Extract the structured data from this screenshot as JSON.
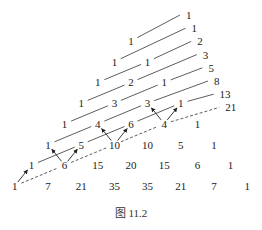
{
  "figure": {
    "caption": "图 11.2",
    "rows": [
      [
        1
      ],
      [
        1,
        1
      ],
      [
        1,
        2,
        1
      ],
      [
        1,
        3,
        3,
        1
      ],
      [
        1,
        4,
        6,
        4,
        1
      ],
      [
        1,
        5,
        10,
        10,
        5,
        1
      ],
      [
        1,
        6,
        15,
        20,
        15,
        6,
        1
      ],
      [
        1,
        7,
        21,
        35,
        35,
        21,
        7,
        1
      ]
    ],
    "diagonal_sums": [
      1,
      1,
      2,
      3,
      5,
      8,
      13,
      21
    ],
    "colors": {
      "ink": "#222222",
      "background": "#ffffff"
    }
  }
}
